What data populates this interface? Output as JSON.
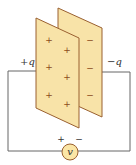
{
  "diagram": {
    "labels": {
      "left_charge": "+q",
      "right_charge": "−q",
      "source_label": "v",
      "source_plus": "+",
      "source_minus": "−"
    },
    "front_plate": {
      "sign": "+",
      "sign_positions": [
        [
          49,
          40
        ],
        [
          67,
          50
        ],
        [
          49,
          67
        ],
        [
          67,
          77
        ],
        [
          49,
          95
        ],
        [
          67,
          104
        ]
      ]
    },
    "back_plate": {
      "sign": "−",
      "sign_positions": [
        [
          90,
          40
        ],
        [
          90,
          68
        ],
        [
          90,
          95
        ]
      ]
    },
    "colors": {
      "plate_fill": "#f8e3a8",
      "plate_edge": "#9a6030",
      "wire": "#666666",
      "source_fill": "#fbe6a6",
      "source_edge": "#9a6030",
      "sign_color": "#8a4b1a"
    }
  }
}
